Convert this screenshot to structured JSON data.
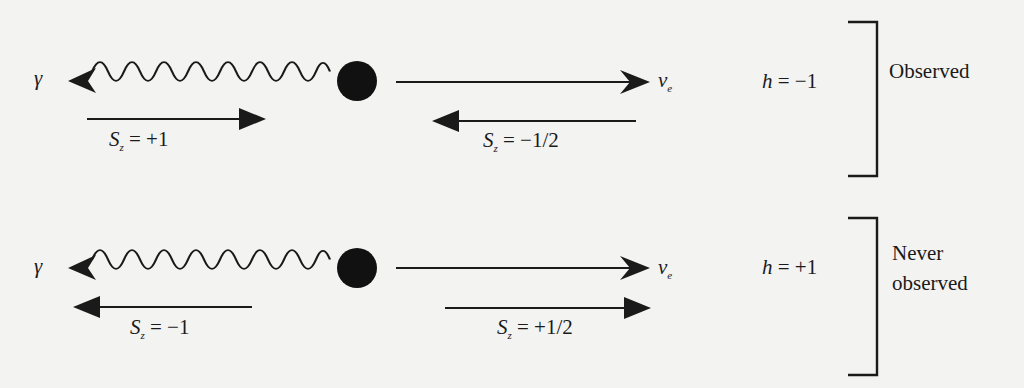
{
  "figure": {
    "rows": [
      {
        "photon_symbol": "γ",
        "neutrino_symbol": "ν",
        "neutrino_subscript": "e",
        "photon_spin": {
          "symbol": "S",
          "subscript": "z",
          "value": "= +1",
          "direction": "right"
        },
        "neutrino_spin": {
          "symbol": "S",
          "subscript": "z",
          "value": "= −1/2",
          "direction": "left"
        },
        "helicity": {
          "symbol": "h",
          "value": "= −1"
        },
        "status": [
          "Observed"
        ]
      },
      {
        "photon_symbol": "γ",
        "neutrino_symbol": "ν",
        "neutrino_subscript": "e",
        "photon_spin": {
          "symbol": "S",
          "subscript": "z",
          "value": "= −1",
          "direction": "left"
        },
        "neutrino_spin": {
          "symbol": "S",
          "subscript": "z",
          "value": "= +1/2",
          "direction": "right"
        },
        "helicity": {
          "symbol": "h",
          "value": "= +1"
        },
        "status": [
          "Never",
          "observed"
        ]
      }
    ]
  },
  "colors": {
    "ink": "#1a1a1a",
    "paper": "#f3f3f1",
    "bleed_through": "#d6d6d3"
  }
}
